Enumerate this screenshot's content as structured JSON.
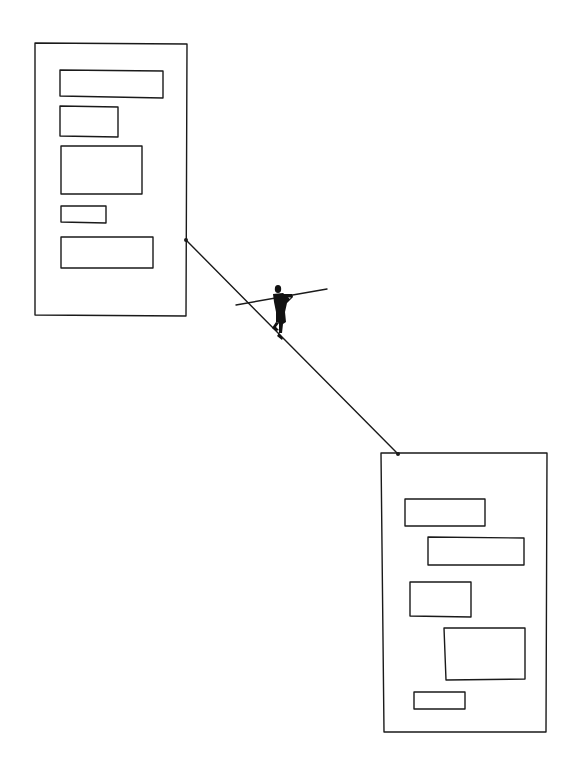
{
  "illustration": {
    "description": "Hand-drawn line illustration of a tightrope walker balancing on a rope stretched between two page wireframes",
    "ink_color": "#1a1a1a",
    "background": "#ffffff",
    "left_page": {
      "frame": [
        34,
        43,
        187,
        316
      ],
      "blocks": [
        [
          60,
          70,
          163,
          97
        ],
        [
          60,
          106,
          118,
          137
        ],
        [
          60,
          146,
          142,
          194
        ],
        [
          61,
          206,
          106,
          223
        ],
        [
          61,
          237,
          153,
          268
        ]
      ]
    },
    "right_page": {
      "frame": [
        381,
        453,
        547,
        732
      ],
      "blocks": [
        [
          405,
          499,
          485,
          526
        ],
        [
          428,
          537,
          524,
          565
        ],
        [
          410,
          582,
          471,
          617
        ],
        [
          444,
          628,
          525,
          680
        ],
        [
          414,
          692,
          465,
          709
        ]
      ]
    },
    "rope": {
      "from": [
        186,
        240
      ],
      "to": [
        398,
        454
      ]
    },
    "figure": {
      "label": "tightrope walker with balance pole"
    }
  }
}
